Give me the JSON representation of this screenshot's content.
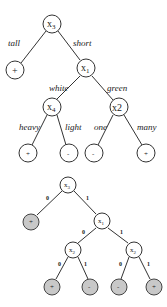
{
  "diagram": {
    "top_tree": {
      "root": {
        "label": "x",
        "sub": "3"
      },
      "nodes": {
        "x3": {
          "label": "x",
          "sub": "3"
        },
        "x1": {
          "label": "x",
          "sub": "1"
        },
        "x4": {
          "label": "x",
          "sub": "4"
        },
        "x2": {
          "label": "x2"
        }
      },
      "leaves": [
        "+",
        "+",
        "-",
        "-",
        "+"
      ],
      "edges": {
        "x3_left": "tall",
        "x3_right": "short",
        "x1_left": "white",
        "x1_right": "green",
        "x4_left": "heavy",
        "x4_right": "light",
        "x2_left": "one",
        "x2_right": "many"
      }
    },
    "bottom_tree": {
      "nodes": {
        "x3": {
          "label": "x",
          "sub": "3"
        },
        "x1": {
          "label": "x",
          "sub": "1"
        },
        "x2_left": {
          "label": "x",
          "sub": "2"
        },
        "x2_right": {
          "label": "x",
          "sub": "2"
        }
      },
      "leaves": [
        "+",
        "+",
        "-",
        "-",
        "+"
      ],
      "edges": {
        "x3_left": "0",
        "x3_right": "1",
        "x1_left": "0",
        "x1_right": "1",
        "x2l_left": "0",
        "x2l_right": "1",
        "x2r_left": "0",
        "x2r_right": "1"
      },
      "leaf_fill": "#c8c8c8"
    }
  }
}
